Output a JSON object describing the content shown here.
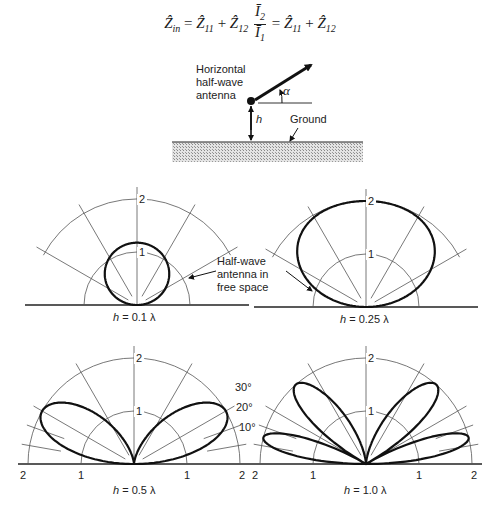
{
  "equation": {
    "lhs": "Ẑ",
    "lhs_sub": "in",
    "z11": "Ẑ",
    "z11_sub": "11",
    "z12": "Ẑ",
    "z12_sub": "12",
    "i2": "Ī",
    "i2_sub": "2",
    "i1": "Ī",
    "i1_sub": "1",
    "eq": "=",
    "plus": "+"
  },
  "antenna_diagram": {
    "label_lines": [
      "Horizontal",
      "half-wave",
      "antenna"
    ],
    "angle_label": "α",
    "height_label": "h",
    "ground_label": "Ground"
  },
  "free_space_note": [
    "Half-wave",
    "antenna in",
    "free space"
  ],
  "angle_ticks": [
    "30°",
    "20°",
    "10°"
  ],
  "panels": [
    {
      "id": "p1",
      "caption_var": "h",
      "caption_rest": " = 0.1 λ",
      "h_over_lambda": 0.1,
      "cx": 137,
      "cy": 305,
      "r1": 53,
      "ring_labels": [
        "1",
        "2"
      ],
      "show_axis_numbers": false
    },
    {
      "id": "p2",
      "caption_var": "h",
      "caption_rest": " = 0.25 λ",
      "h_over_lambda": 0.25,
      "cx": 366,
      "cy": 307,
      "r1": 53,
      "ring_labels": [
        "1",
        "2"
      ],
      "show_axis_numbers": false
    },
    {
      "id": "p3",
      "caption_var": "h",
      "caption_rest": " = 0.5 λ",
      "h_over_lambda": 0.5,
      "cx": 134,
      "cy": 464,
      "r1": 53,
      "ring_labels": [
        "1",
        "2"
      ],
      "show_axis_numbers": true,
      "axis_numbers": [
        "2",
        "1",
        "1",
        "2"
      ]
    },
    {
      "id": "p4",
      "caption_var": "h",
      "caption_rest": " = 1.0 λ",
      "h_over_lambda": 1.0,
      "cx": 366,
      "cy": 464,
      "r1": 53,
      "ring_labels": [
        "1",
        "2"
      ],
      "show_axis_numbers": true,
      "axis_numbers": [
        "2",
        "1",
        "1",
        "2"
      ]
    }
  ],
  "chart_data": {
    "type": "polar",
    "quantity": "relative field strength |2 sin(2π(h/λ) sin α)|",
    "radial_ticks": [
      1,
      2
    ],
    "angle_ticks_deg": [
      10,
      20,
      30,
      60
    ],
    "series": [
      {
        "name": "h = 0.1 λ",
        "lobes": 1,
        "max_value": 1.18,
        "max_at_deg": 90
      },
      {
        "name": "h = 0.25 λ",
        "lobes": 1,
        "max_value": 2.0,
        "max_at_deg": 90
      },
      {
        "name": "h = 0.5 λ",
        "lobes": 2,
        "max_value": 2.0,
        "max_at_deg": 30
      },
      {
        "name": "h = 1.0 λ",
        "lobes": 4,
        "max_value": 2.0,
        "max_at_deg": [
          14.5,
          48.6
        ]
      }
    ],
    "reference": "Half-wave antenna in free space (radius 1 semicircle)"
  },
  "colors": {
    "pattern": "#111111",
    "grid": "#555555",
    "ground": "#bdbdbd"
  }
}
